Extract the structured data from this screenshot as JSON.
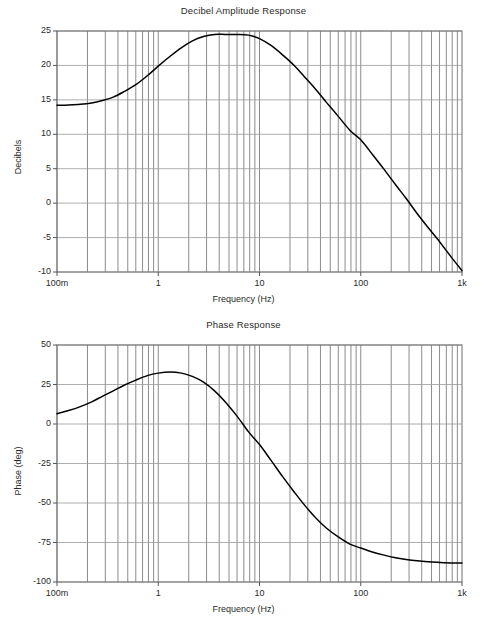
{
  "figure": {
    "background": "#ffffff",
    "curve_color": "#000000",
    "grid_major_color": "#9a9a9a",
    "grid_minor_color": "#6f6f6f",
    "axis_color": "#555555"
  },
  "chart_data": [
    {
      "type": "line",
      "id": "amplitude",
      "title": "Decibel Amplitude Response",
      "xlabel": "Frequency (Hz)",
      "ylabel": "Decibels",
      "xscale": "log",
      "xlim": [
        0.1,
        1000
      ],
      "ylim": [
        -10,
        25
      ],
      "grid": true,
      "legend": "none",
      "xticks": [
        0.1,
        1,
        10,
        100,
        1000
      ],
      "xticklabels": [
        "100m",
        "1",
        "10",
        "100",
        "1k"
      ],
      "yticks": [
        -10,
        -5,
        0,
        5,
        10,
        15,
        20,
        25
      ],
      "yticklabels": [
        "-10",
        "-5",
        "0",
        "5",
        "10",
        "15",
        "20",
        "25"
      ],
      "series": [
        {
          "name": "Decibel Amplitude Response",
          "x": [
            0.1,
            0.13,
            0.17,
            0.22,
            0.28,
            0.36,
            0.46,
            0.6,
            0.78,
            1.0,
            1.3,
            1.7,
            2.2,
            2.8,
            3.6,
            4.6,
            6.0,
            7.8,
            10.0,
            13.0,
            17.0,
            22.0,
            28.0,
            36.0,
            46.0,
            60.0,
            78.0,
            100.0,
            130.0,
            170.0,
            220.0,
            280.0,
            360.0,
            460.0,
            600.0,
            780.0,
            1000.0
          ],
          "y": [
            14.2,
            14.25,
            14.35,
            14.55,
            14.9,
            15.4,
            16.2,
            17.2,
            18.5,
            19.9,
            21.3,
            22.6,
            23.6,
            24.2,
            24.5,
            24.5,
            24.5,
            24.4,
            23.9,
            22.9,
            21.5,
            20.0,
            18.3,
            16.5,
            14.6,
            12.6,
            10.6,
            9.2,
            7.1,
            4.9,
            2.7,
            0.7,
            -1.5,
            -3.5,
            -5.6,
            -7.8,
            -9.8
          ]
        }
      ]
    },
    {
      "type": "line",
      "id": "phase",
      "title": "Phase Response",
      "xlabel": "Frequency (Hz)",
      "ylabel": "Phase (deg)",
      "xscale": "log",
      "xlim": [
        0.1,
        1000
      ],
      "ylim": [
        -100,
        50
      ],
      "grid": true,
      "legend": "none",
      "xticks": [
        0.1,
        1,
        10,
        100,
        1000
      ],
      "xticklabels": [
        "100m",
        "1",
        "10",
        "100",
        "1k"
      ],
      "yticks": [
        -100,
        -75,
        -50,
        -25,
        0,
        25,
        50
      ],
      "yticklabels": [
        "-100",
        "-75",
        "-50",
        "-25",
        "0",
        "25",
        "50"
      ],
      "series": [
        {
          "name": "Phase Response",
          "x": [
            0.1,
            0.13,
            0.17,
            0.22,
            0.28,
            0.36,
            0.46,
            0.6,
            0.78,
            1.0,
            1.3,
            1.7,
            2.2,
            2.8,
            3.6,
            4.6,
            6.0,
            7.8,
            10.0,
            13.0,
            17.0,
            22.0,
            28.0,
            36.0,
            46.0,
            60.0,
            78.0,
            100.0,
            130.0,
            170.0,
            220.0,
            280.0,
            360.0,
            460.0,
            600.0,
            780.0,
            1000.0
          ],
          "y": [
            6.5,
            8.5,
            11.0,
            14.0,
            17.5,
            21.0,
            24.5,
            27.8,
            30.6,
            32.2,
            32.9,
            32.2,
            30.0,
            26.5,
            21.0,
            14.0,
            5.0,
            -5.0,
            -13.0,
            -23.0,
            -33.5,
            -43.0,
            -51.5,
            -59.5,
            -66.0,
            -71.5,
            -76.0,
            -78.5,
            -81.0,
            -83.0,
            -84.6,
            -85.7,
            -86.6,
            -87.2,
            -87.6,
            -87.9,
            -88.0
          ]
        }
      ]
    }
  ]
}
